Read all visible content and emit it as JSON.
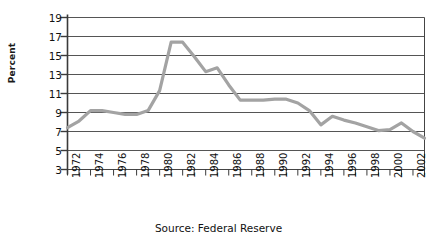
{
  "caption": "Source: Federal Reserve",
  "axis": {
    "ylabel": "Percent",
    "yticks": [
      "19",
      "17",
      "15",
      "13",
      "11",
      "9",
      "7",
      "5",
      "3"
    ],
    "xticks_labeled": [
      "1972",
      "1974",
      "1976",
      "1978",
      "1980",
      "1982",
      "1984",
      "1986",
      "1988",
      "1990",
      "1992",
      "1994",
      "1996",
      "1998",
      "2000",
      "2002"
    ]
  },
  "colors": {
    "line": "#a3a3a3",
    "grid": "#555555",
    "frame": "#444444",
    "text": "#111111",
    "background": "#ffffff"
  },
  "chart_data": {
    "type": "line",
    "title": "",
    "subtitle": "",
    "xlabel": "",
    "ylabel": "Percent",
    "annotation": "Source: Federal Reserve",
    "legend": [],
    "legend_position": "none",
    "grid": true,
    "xlim": [
      1972,
      2003
    ],
    "ylim": [
      3,
      19
    ],
    "ytick_values": [
      19,
      17,
      15,
      13,
      11,
      9,
      7,
      5,
      3
    ],
    "ytick_step": 2,
    "xtick_step_minor": 1,
    "xtick_step_labeled": 2,
    "x": [
      1972,
      1973,
      1974,
      1975,
      1976,
      1977,
      1978,
      1979,
      1980,
      1981,
      1982,
      1983,
      1984,
      1985,
      1986,
      1987,
      1988,
      1989,
      1990,
      1991,
      1992,
      1993,
      1994,
      1995,
      1996,
      1997,
      1998,
      1999,
      2000,
      2001,
      2002,
      2003
    ],
    "values": [
      7.4,
      8.1,
      9.2,
      9.2,
      9.0,
      8.8,
      8.8,
      9.2,
      11.3,
      16.4,
      16.4,
      14.9,
      13.3,
      13.7,
      11.9,
      10.3,
      10.3,
      10.3,
      10.4,
      10.4,
      10.0,
      9.2,
      7.7,
      8.6,
      8.2,
      7.9,
      7.5,
      7.1,
      7.2,
      7.9,
      7.0,
      6.3
    ],
    "series": [
      {
        "name": "Percent",
        "values": [
          7.4,
          8.1,
          9.2,
          9.2,
          9.0,
          8.8,
          8.8,
          9.2,
          11.3,
          16.4,
          16.4,
          14.9,
          13.3,
          13.7,
          11.9,
          10.3,
          10.3,
          10.3,
          10.4,
          10.4,
          10.0,
          9.2,
          7.7,
          8.6,
          8.2,
          7.9,
          7.5,
          7.1,
          7.2,
          7.9,
          7.0,
          6.3
        ]
      }
    ]
  }
}
